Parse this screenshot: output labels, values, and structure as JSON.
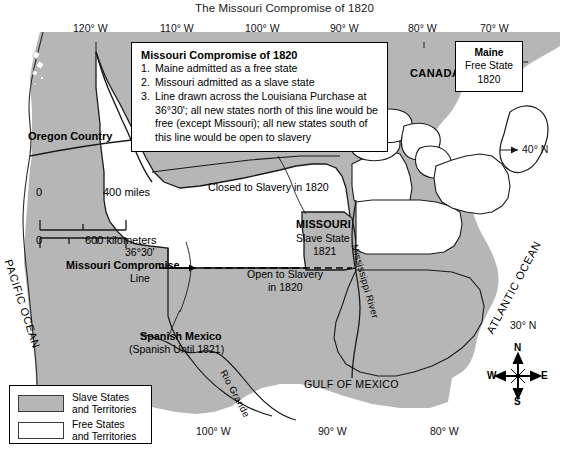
{
  "title": "The Missouri Compromise of 1820",
  "colors": {
    "slave_fill": "#b6b6b6",
    "free_fill": "#ffffff",
    "outline": "#1a1a1a",
    "ocean": "#ffffff",
    "text": "#000000"
  },
  "infobox": {
    "heading": "Missouri Compromise of 1820",
    "items": [
      {
        "num": "1.",
        "text": "Maine admitted as a free state"
      },
      {
        "num": "2.",
        "text": "Missouri admitted as a slave state"
      },
      {
        "num": "3.",
        "text": "Line drawn across the Louisiana Purchase at 36°30'; all new states north of this line would be free (except Missouri); all new states south of this line would be open to slavery"
      }
    ]
  },
  "maine_box": {
    "line1": "Maine",
    "line2": "Free State",
    "line3": "1820"
  },
  "legend": {
    "entries": [
      {
        "swatch": "slave",
        "line1": "Slave States",
        "line2": "and Territories"
      },
      {
        "swatch": "free",
        "line1": "Free States",
        "line2": "and Territories"
      }
    ]
  },
  "scale_bar": {
    "miles_zero": "0",
    "miles_label": "400 miles",
    "km_zero": "0",
    "km_label": "600 kilometers"
  },
  "compass": {
    "north": "N",
    "south": "S",
    "east": "E",
    "west": "W"
  },
  "graticule": {
    "top": [
      "120° W",
      "110° W",
      "100° W",
      "90° W",
      "80° W",
      "70° W"
    ],
    "bottom": [
      "100° W",
      "90° W",
      "80° W"
    ],
    "right": [
      "40° N",
      "30° N"
    ]
  },
  "map_labels": {
    "oregon_country": "Oregon Country",
    "canada": "CANADA",
    "closed_to_slavery": "Closed to Slavery in 1820",
    "missouri_name": "MISSOURI",
    "missouri_status": "Slave State",
    "missouri_year": "1821",
    "open_to_slavery_1": "Open to Slavery",
    "open_to_slavery_2": "in 1820",
    "compromise_lat": "36°30'",
    "compromise_name": "Missouri Compromise",
    "compromise_word_line": "Line",
    "spanish_mexico": "Spanish Mexico",
    "spanish_until": "(Spanish Until 1821)",
    "rio_grande": "Rio Grande",
    "mississippi_river": "Mississippi River",
    "gulf_of_mexico": "GULF OF MEXICO",
    "pacific_ocean": "PACIFIC OCEAN",
    "atlantic_ocean": "ATLANTIC OCEAN"
  }
}
